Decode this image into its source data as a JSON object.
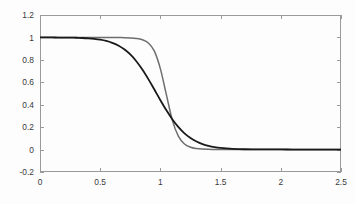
{
  "chart_data": {
    "type": "line",
    "title": "",
    "subtitle": "",
    "xlabel": "",
    "ylabel": "",
    "xlim": [
      0,
      2.5
    ],
    "ylim": [
      -0.2,
      1.2
    ],
    "grid": false,
    "legend": null,
    "background_color": "#fdfdfd",
    "axis_color": "#9a9a9a",
    "xticks": [
      0,
      0.5,
      1,
      1.5,
      2,
      2.5
    ],
    "xticklabels": [
      "0",
      "0.5",
      "1",
      "1.5",
      "2",
      "2.5"
    ],
    "yticks": [
      -0.2,
      0,
      0.2,
      0.4,
      0.6,
      0.8,
      1,
      1.2
    ],
    "yticklabels": [
      "-0.2",
      "0",
      "0.2",
      "0.4",
      "0.6",
      "0.8",
      "1",
      "1.2"
    ],
    "x": [
      0,
      0.05,
      0.1,
      0.15,
      0.2,
      0.25,
      0.3,
      0.35,
      0.4,
      0.45,
      0.5,
      0.55,
      0.6,
      0.65,
      0.7,
      0.75,
      0.8,
      0.85,
      0.9,
      0.95,
      1,
      1.05,
      1.1,
      1.15,
      1.2,
      1.25,
      1.3,
      1.35,
      1.4,
      1.45,
      1.5,
      1.6,
      1.7,
      1.8,
      1.9,
      2,
      2.1,
      2.2,
      2.3,
      2.4,
      2.5
    ],
    "series": [
      {
        "name": "smooth-transition",
        "color": "#1a1a1a",
        "width": 1.8,
        "values": [
          1,
          1,
          1,
          0.999,
          0.999,
          0.998,
          0.997,
          0.995,
          0.992,
          0.987,
          0.98,
          0.969,
          0.952,
          0.928,
          0.894,
          0.848,
          0.788,
          0.714,
          0.628,
          0.535,
          0.44,
          0.35,
          0.269,
          0.2,
          0.145,
          0.103,
          0.072,
          0.049,
          0.033,
          0.022,
          0.015,
          0.007,
          0.003,
          0.002,
          0.001,
          0.001,
          0,
          0,
          0,
          0,
          0
        ]
      },
      {
        "name": "sharp-transition",
        "color": "#6e6e6e",
        "width": 1.5,
        "values": [
          1,
          1,
          1,
          1,
          1,
          1,
          1,
          1,
          1,
          1,
          1,
          1,
          0.999,
          0.999,
          0.998,
          0.996,
          0.991,
          0.979,
          0.95,
          0.878,
          0.72,
          0.488,
          0.258,
          0.118,
          0.05,
          0.021,
          0.009,
          0.004,
          0.002,
          0.001,
          0.001,
          0,
          0,
          0,
          0,
          0,
          0,
          0,
          0,
          0,
          0
        ]
      }
    ]
  },
  "axes": {
    "plot_box": {
      "left": 40,
      "top": 15,
      "right": 341,
      "bottom": 172
    }
  }
}
